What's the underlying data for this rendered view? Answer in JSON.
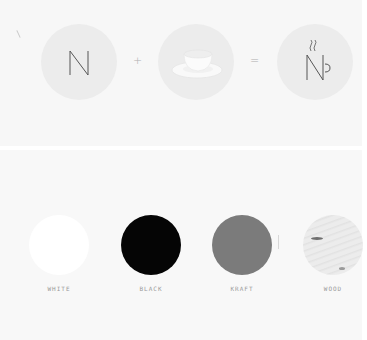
{
  "logo_equation": {
    "items": [
      {
        "name": "letter-n",
        "glyph": "N"
      },
      {
        "name": "cup-and-saucer",
        "glyph": ""
      },
      {
        "name": "n-cup-logo",
        "glyph": "N"
      }
    ],
    "operators": {
      "plus": "+",
      "equals": "="
    },
    "colors": {
      "circle_bg": "#ececec",
      "stroke": "#555555"
    }
  },
  "swatches": {
    "items": [
      {
        "label": "WHITE",
        "color": "#ffffff"
      },
      {
        "label": "BLACK",
        "color": "#050505"
      },
      {
        "label": "KRAFT",
        "color": "#7b7b7b"
      },
      {
        "label": "WOOD",
        "color": "#ececec"
      }
    ]
  }
}
